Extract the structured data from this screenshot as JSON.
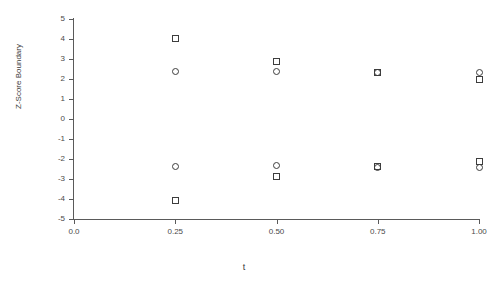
{
  "chart_data": {
    "type": "scatter",
    "title": "",
    "xlabel": "t",
    "ylabel": "Z-Score Boundary",
    "xlim": [
      0.0,
      1.0
    ],
    "ylim": [
      -5,
      5
    ],
    "grid": false,
    "legend": "none",
    "xticks": [
      0.0,
      0.25,
      0.5,
      0.75,
      1.0
    ],
    "xtick_labels": [
      "0.0",
      "0.25",
      "0.50",
      "0.75",
      "1.00"
    ],
    "yticks": [
      5,
      4,
      3,
      2,
      1,
      0,
      -1,
      -2,
      -3,
      -4,
      -5
    ],
    "ytick_labels": [
      "5",
      "4",
      "3",
      "2",
      "1",
      "0",
      "-1",
      "-2",
      "-3",
      "-4",
      "-5"
    ],
    "marker_color": "#3d3d3d",
    "axis_color": "#5a5a5a",
    "series": [
      {
        "name": "square-series",
        "marker": "square",
        "x": [
          0.25,
          0.25,
          0.5,
          0.5,
          0.75,
          0.75,
          1.0,
          1.0
        ],
        "y": [
          4.05,
          -4.05,
          2.87,
          -2.87,
          2.33,
          -2.37,
          2.0,
          -2.1
        ]
      },
      {
        "name": "circle-series",
        "marker": "circle",
        "x": [
          0.25,
          0.25,
          0.5,
          0.5,
          0.75,
          0.75,
          1.0,
          1.0
        ],
        "y": [
          2.37,
          -2.35,
          2.37,
          -2.33,
          2.35,
          -2.4,
          2.33,
          -2.4
        ]
      }
    ],
    "points": [
      {
        "t": 0.25,
        "z": 4.05,
        "marker": "square"
      },
      {
        "t": 0.25,
        "z": 2.37,
        "marker": "circle"
      },
      {
        "t": 0.25,
        "z": -2.35,
        "marker": "circle"
      },
      {
        "t": 0.25,
        "z": -4.05,
        "marker": "square"
      },
      {
        "t": 0.5,
        "z": 2.87,
        "marker": "square"
      },
      {
        "t": 0.5,
        "z": 2.37,
        "marker": "circle"
      },
      {
        "t": 0.5,
        "z": -2.33,
        "marker": "circle"
      },
      {
        "t": 0.5,
        "z": -2.87,
        "marker": "square"
      },
      {
        "t": 0.75,
        "z": 2.33,
        "marker": "square"
      },
      {
        "t": 0.75,
        "z": 2.35,
        "marker": "circle"
      },
      {
        "t": 0.75,
        "z": -2.37,
        "marker": "square"
      },
      {
        "t": 0.75,
        "z": -2.4,
        "marker": "circle"
      },
      {
        "t": 1.0,
        "z": 2.33,
        "marker": "circle"
      },
      {
        "t": 1.0,
        "z": 2.0,
        "marker": "square"
      },
      {
        "t": 1.0,
        "z": -2.1,
        "marker": "square"
      },
      {
        "t": 1.0,
        "z": -2.4,
        "marker": "circle"
      }
    ]
  }
}
